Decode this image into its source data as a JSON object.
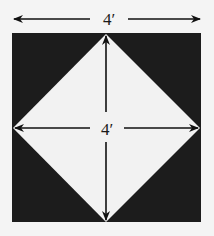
{
  "diagram": {
    "top_dimension": {
      "label": "4′"
    },
    "inner_dimension": {
      "label": "4′"
    },
    "colors": {
      "background": "#f4f4f4",
      "square_fill": "#1c1c1c",
      "diamond_fill": "#f2f2f2",
      "line": "#111111"
    }
  }
}
